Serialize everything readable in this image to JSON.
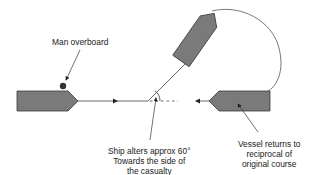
{
  "diagram": {
    "labels": {
      "man_overboard": "Man overboard",
      "ship_alters": [
        "Ship alters approx 60°",
        "Towards the side of",
        "the casualty"
      ],
      "vessel_returns": [
        "Vessel returns to",
        "reciprocal of",
        "original course"
      ]
    },
    "colors": {
      "vessel_fill": "#7a7a7a",
      "vessel_stroke": "#3a3a3a",
      "track": "#444444",
      "person": "#333333",
      "text": "#222222"
    },
    "elements": {
      "vessel_initial": {
        "heading": "east"
      },
      "vessel_altered": {
        "turn_angle_deg": 60
      },
      "vessel_final": {
        "heading": "west"
      },
      "person_in_water": {
        "marker": "dot"
      }
    }
  }
}
